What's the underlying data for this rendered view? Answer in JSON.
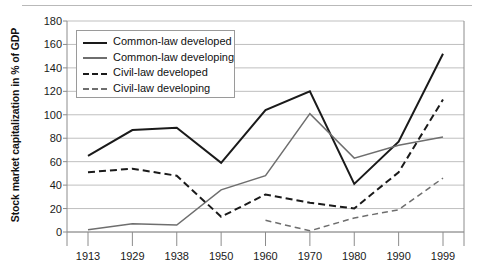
{
  "chart_data": {
    "type": "line",
    "title": "",
    "xlabel": "",
    "ylabel": "Stock market capitalization in % of GDP",
    "categories": [
      "1913",
      "1929",
      "1938",
      "1950",
      "1960",
      "1970",
      "1980",
      "1990",
      "1999"
    ],
    "ylim": [
      0,
      180
    ],
    "yticks": [
      0,
      20,
      40,
      60,
      80,
      100,
      120,
      140,
      160,
      180
    ],
    "ytick_labels": [
      "0",
      "20",
      "40",
      "60",
      "80",
      "100",
      "120",
      "140",
      "160",
      "180"
    ],
    "grid": true,
    "legend_position": "upper-left-inside",
    "series": [
      {
        "name": "Common-law developed",
        "style": "solid",
        "color": "#1a1a1a",
        "width": 2,
        "x": [
          "1913",
          "1929",
          "1938",
          "1950",
          "1960",
          "1970",
          "1980",
          "1990",
          "1999"
        ],
        "values": [
          65,
          87,
          89,
          59,
          104,
          120,
          41,
          77,
          152
        ]
      },
      {
        "name": "Common-law developing",
        "style": "solid",
        "color": "#6e6e6e",
        "width": 1.5,
        "x": [
          "1913",
          "1929",
          "1938",
          "1950",
          "1960",
          "1970",
          "1980",
          "1990",
          "1999"
        ],
        "values": [
          2,
          7,
          6,
          36,
          48,
          101,
          63,
          74,
          81
        ]
      },
      {
        "name": "Civil-law developed",
        "style": "dashed",
        "color": "#1a1a1a",
        "width": 2,
        "x": [
          "1913",
          "1929",
          "1938",
          "1950",
          "1960",
          "1970",
          "1980",
          "1990",
          "1999"
        ],
        "values": [
          51,
          54,
          48,
          13,
          32,
          25,
          20,
          51,
          113
        ]
      },
      {
        "name": "Civil-law developing",
        "style": "dashed",
        "color": "#6e6e6e",
        "width": 1.5,
        "x": [
          "1960",
          "1970",
          "1980",
          "1990",
          "1999"
        ],
        "values": [
          10,
          1,
          12,
          19,
          46
        ]
      }
    ]
  },
  "legend": {
    "items": [
      {
        "label": "Common-law developed"
      },
      {
        "label": "Common-law developing"
      },
      {
        "label": "Civil-law developed"
      },
      {
        "label": "Civil-law developing"
      }
    ]
  },
  "colors": {
    "grid": "#bfbfbf",
    "axis": "#8c8c8c",
    "dark_series": "#1a1a1a",
    "light_series": "#6e6e6e",
    "text": "#1a1a1a"
  }
}
